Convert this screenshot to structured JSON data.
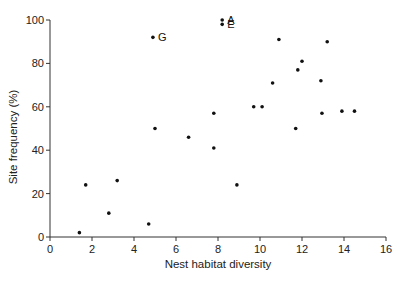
{
  "chart_data": {
    "type": "scatter",
    "title": "",
    "xlabel": "Nest habitat diversity",
    "ylabel": "Site frequency (%)",
    "xlim": [
      0,
      16
    ],
    "ylim": [
      0,
      100
    ],
    "x_ticks": [
      0,
      2,
      4,
      6,
      8,
      10,
      12,
      14,
      16
    ],
    "y_ticks": [
      0,
      20,
      40,
      60,
      80,
      100
    ],
    "grid": false,
    "legend": null,
    "points": [
      {
        "x": 1.4,
        "y": 2,
        "label": ""
      },
      {
        "x": 1.7,
        "y": 24,
        "label": ""
      },
      {
        "x": 2.8,
        "y": 11,
        "label": ""
      },
      {
        "x": 3.2,
        "y": 26,
        "label": ""
      },
      {
        "x": 4.7,
        "y": 6,
        "label": ""
      },
      {
        "x": 4.9,
        "y": 92,
        "label": "G"
      },
      {
        "x": 5.0,
        "y": 50,
        "label": ""
      },
      {
        "x": 6.6,
        "y": 46,
        "label": ""
      },
      {
        "x": 7.8,
        "y": 41,
        "label": ""
      },
      {
        "x": 7.8,
        "y": 57,
        "label": ""
      },
      {
        "x": 8.2,
        "y": 100,
        "label": "A"
      },
      {
        "x": 8.2,
        "y": 98,
        "label": "E"
      },
      {
        "x": 8.9,
        "y": 24,
        "label": ""
      },
      {
        "x": 9.7,
        "y": 60,
        "label": ""
      },
      {
        "x": 10.1,
        "y": 60,
        "label": ""
      },
      {
        "x": 10.6,
        "y": 71,
        "label": ""
      },
      {
        "x": 10.9,
        "y": 91,
        "label": ""
      },
      {
        "x": 11.7,
        "y": 50,
        "label": ""
      },
      {
        "x": 11.8,
        "y": 77,
        "label": ""
      },
      {
        "x": 12.0,
        "y": 81,
        "label": ""
      },
      {
        "x": 12.9,
        "y": 72,
        "label": ""
      },
      {
        "x": 12.95,
        "y": 57,
        "label": ""
      },
      {
        "x": 13.2,
        "y": 90,
        "label": ""
      },
      {
        "x": 13.9,
        "y": 58,
        "label": ""
      },
      {
        "x": 14.5,
        "y": 58,
        "label": ""
      }
    ],
    "colors": {
      "point": "#111111",
      "axis": "#333333"
    }
  }
}
